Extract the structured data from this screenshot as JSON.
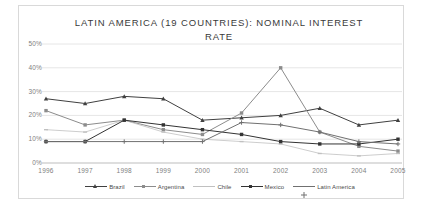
{
  "chart_data": {
    "type": "line",
    "title": "LATIN AMERICA (19 COUNTRIES): NOMINAL INTEREST RATE",
    "xlabel": "",
    "ylabel": "",
    "categories": [
      "1996",
      "1997",
      "1998",
      "1999",
      "2000",
      "2001",
      "2002",
      "2003",
      "2004",
      "2005"
    ],
    "ylim": [
      0,
      50
    ],
    "yticks": [
      "0%",
      "10%",
      "20%",
      "30%",
      "40%",
      "50%"
    ],
    "ytick_values": [
      0,
      10,
      20,
      30,
      40,
      50
    ],
    "grid": true,
    "legend_position": "bottom",
    "series": [
      {
        "name": "Brazil",
        "color": "#404040",
        "marker": "triangle",
        "values": [
          27,
          25,
          28,
          27,
          18,
          19,
          20,
          23,
          16,
          18
        ]
      },
      {
        "name": "Argentina",
        "color": "#8c8c8c",
        "marker": "square",
        "values": [
          22,
          16,
          18,
          14,
          12,
          21,
          40,
          13,
          7,
          5
        ]
      },
      {
        "name": "Chile",
        "color": "#c0c0c0",
        "marker": "dash",
        "values": [
          14,
          13,
          18,
          13,
          10,
          9,
          8,
          4,
          3,
          4
        ]
      },
      {
        "name": "Mexico",
        "color": "#333333",
        "marker": "square",
        "values": [
          9,
          9,
          18,
          16,
          14,
          12,
          9,
          8,
          8,
          10
        ]
      },
      {
        "name": "Latin America",
        "color": "#707070",
        "marker": "plus",
        "values": [
          9,
          9,
          9,
          9,
          9,
          17,
          16,
          13,
          9,
          8
        ]
      }
    ]
  },
  "legend": {
    "items": [
      {
        "label": "Brazil"
      },
      {
        "label": "Argentina"
      },
      {
        "label": "Chile"
      },
      {
        "label": "Mexico"
      },
      {
        "label": "Latin America"
      }
    ]
  }
}
